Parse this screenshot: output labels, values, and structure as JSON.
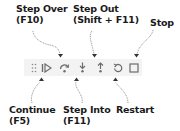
{
  "labels": {
    "step_over": "Step Over\n(F10)",
    "step_out": "Step Out\n(Shift + F11)",
    "stop": "Stop",
    "continue": "Continue\n(F5)",
    "step_into": "Step Into\n(F11)",
    "restart": "Restart"
  },
  "toolbar": {
    "icons": [
      "drag-handle-icon",
      "continue-icon",
      "step-over-icon",
      "step-into-icon",
      "step-out-icon",
      "restart-icon",
      "stop-icon"
    ],
    "icon_color": "#6c6c6c",
    "background": "#f3f3f3"
  }
}
